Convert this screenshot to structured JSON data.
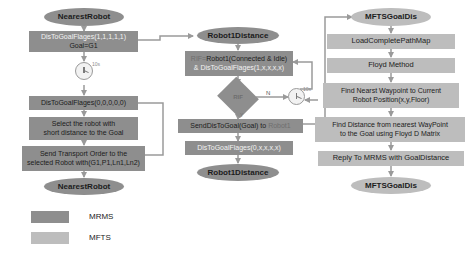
{
  "diagram": {
    "colors": {
      "mrms_fill": "#8e8e8e",
      "mfts_fill": "#bdbdbd",
      "arrow": "#9a9a9a",
      "text_dark": "#1c1c1c",
      "text_light": "#f2f2f2"
    }
  },
  "left_column": {
    "start_terminal": "NearestRobot",
    "set_flags_box": {
      "line1": "DisToGoalFlages(1,1,1,1,1)",
      "line2": "Goal=G1"
    },
    "timer_label": "10s",
    "clear_flags_box": "DisToGoalFlages(0,0,0,0,0)",
    "select_robot_box": {
      "line1": "Select the robot with",
      "line2": "short distance to the Goal"
    },
    "send_order_box": {
      "line1": "Send Transport Order to the",
      "line2": "selected Robot with(G1,P1,Ln1,Ln2)"
    },
    "end_terminal": "NearestRobot"
  },
  "middle_column": {
    "top_terminal": "Robot1Distance",
    "condition_box": {
      "line1_prefix": "RIF=",
      "line1": "Robot1(Connected & Idle)",
      "line2_prefix": "& ",
      "line2": "DisToGoalFlages(1,x,x,x,x)"
    },
    "decision": {
      "label": "RIF",
      "yes_label": "Y",
      "no_label": "N"
    },
    "timer_label": "10s",
    "send_request_box": {
      "prefix": "SendDisToGoal(Goal) to ",
      "target": "Robot1"
    },
    "update_flags_box": "DisToGoalFlages(0,x,x,x,x)",
    "bottom_terminal": "Robot1Distance"
  },
  "right_column": {
    "start_terminal": "MFTSGoalDis",
    "steps": [
      "LoadCompletePathMap",
      "Floyd Method"
    ],
    "find_waypoint_box": {
      "line1": "Find Nearst Waypoint to Current",
      "line2": "Robot Position(x,y,Floor)"
    },
    "find_distance_box": {
      "line1": "Find Distance from nearest WayPoint",
      "line2": "to the Goal using Floyd D Matrix"
    },
    "reply_box": "Reply To MRMS with GoalDistance",
    "end_terminal": "MFTSGoalDis"
  },
  "legend": {
    "items": [
      {
        "label": "MRMS",
        "color": "#8e8e8e"
      },
      {
        "label": "MFTS",
        "color": "#bdbdbd"
      }
    ]
  }
}
